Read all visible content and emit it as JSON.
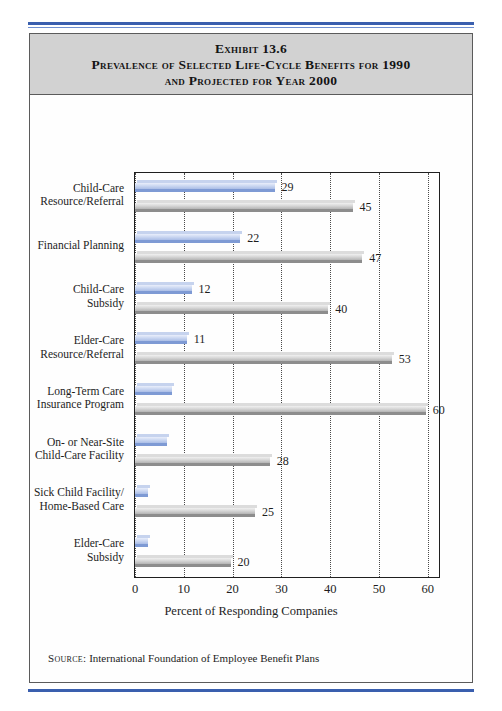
{
  "exhibit": {
    "title_lines": [
      "Exhibit 13.6",
      "Prevalence of Selected Life-Cycle Benefits for 1990",
      "and Projected for Year 2000"
    ],
    "source_keyword": "Source:",
    "source_text": "International Foundation of Employee Benefit Plans"
  },
  "chart_data": {
    "type": "bar",
    "orientation": "horizontal",
    "title": "Prevalence of Selected Life-Cycle Benefits for 1990 and Projected for Year 2000",
    "xlabel": "Percent of Responding Companies",
    "ylabel": "",
    "xlim": [
      0,
      62.5
    ],
    "xticks": [
      0,
      10,
      20,
      30,
      40,
      50,
      60
    ],
    "grid": "vertical-dotted",
    "legend": "none",
    "categories": [
      "Child-Care Resource/Referral",
      "Financial Planning",
      "Child-Care Subsidy",
      "Elder-Care Resource/Referral",
      "Long-Term Care Insurance Program",
      "On- or Near-Site Child-Care Facility",
      "Sick Child Facility/ Home-Based Care",
      "Elder-Care Subsidy"
    ],
    "category_lines": [
      [
        "Child-Care",
        "Resource/Referral"
      ],
      [
        "Financial Planning"
      ],
      [
        "Child-Care",
        "Subsidy"
      ],
      [
        "Elder-Care",
        "Resource/Referral"
      ],
      [
        "Long-Term Care",
        "Insurance Program"
      ],
      [
        "On- or Near-Site",
        "Child-Care Facility"
      ],
      [
        "Sick Child Facility/",
        "Home-Based Care"
      ],
      [
        "Elder-Care",
        "Subsidy"
      ]
    ],
    "series": [
      {
        "name": "1990",
        "color": "#aabde6",
        "values": [
          29,
          22,
          12,
          11,
          8,
          7,
          3,
          3
        ],
        "labels": [
          "29",
          "22",
          "12",
          "11",
          "",
          "",
          "",
          ""
        ]
      },
      {
        "name": "Projected 2000",
        "color": "#d8d8d8",
        "values": [
          45,
          47,
          40,
          53,
          60,
          28,
          25,
          20
        ],
        "labels": [
          "45",
          "47",
          "40",
          "53",
          "60",
          "28",
          "25",
          "20"
        ]
      }
    ]
  }
}
